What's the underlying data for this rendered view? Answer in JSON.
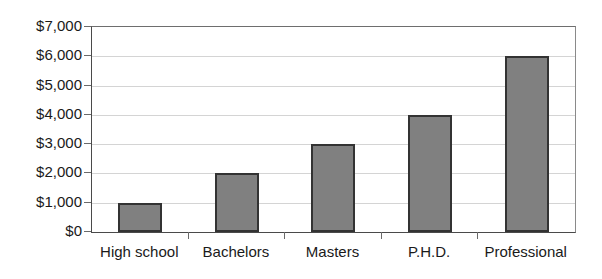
{
  "chart_data": {
    "type": "bar",
    "title": "",
    "subtitle": "",
    "xlabel": "",
    "ylabel": "",
    "categories": [
      "High school",
      "Bachelors",
      "Masters",
      "P.H.D.",
      "Professional"
    ],
    "values": [
      1000,
      2000,
      3000,
      4000,
      6000
    ],
    "series": [
      {
        "name": "",
        "values": [
          1000,
          2000,
          3000,
          4000,
          6000
        ]
      }
    ],
    "ylim": [
      0,
      7000
    ],
    "ytick_values": [
      0,
      1000,
      2000,
      3000,
      4000,
      5000,
      6000,
      7000
    ],
    "ytick_labels": [
      "$0",
      "$1,000",
      "$2,000",
      "$3,000",
      "$4,000",
      "$5,000",
      "$6,000",
      "$7,000"
    ],
    "grid": true,
    "grid_axis": "y",
    "legend": false,
    "legend_position": "none",
    "annotations": [],
    "colors": {
      "bar_fill": "#808080",
      "bar_border": "#333333",
      "gridline": "#d4d4d4",
      "axis_line": "#4a4a4a",
      "plot_border": "#8a8a8a",
      "text": "#1a1a1a",
      "background": "#ffffff"
    }
  }
}
